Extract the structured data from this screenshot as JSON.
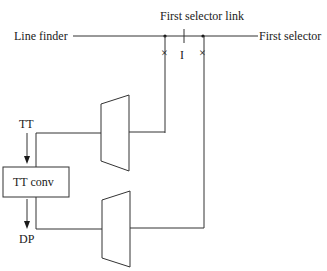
{
  "diagram": {
    "labels": {
      "top_link": "First selector link",
      "line_finder": "Line finder",
      "first_selector": "First selector",
      "link_marker": "I",
      "cross_left": "×",
      "cross_right": "×",
      "tt": "TT",
      "tt_conv": "TT conv",
      "dp": "DP"
    },
    "colors": {
      "line": "#333333",
      "text": "#1a1a1a",
      "background": "#ffffff"
    }
  }
}
